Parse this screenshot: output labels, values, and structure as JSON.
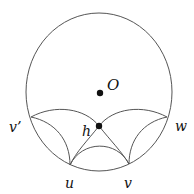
{
  "diagram": {
    "title": "",
    "stroke_color": "#555555",
    "point_color": "#111111",
    "boundary_circle": {
      "cx": 99,
      "cy": 92,
      "rx": 73,
      "ry": 79
    },
    "points": [
      {
        "id": "O",
        "label": "O",
        "x": 100,
        "y": 93,
        "dot": true
      },
      {
        "id": "h",
        "label": "h",
        "x": 99,
        "y": 126,
        "dot": true
      },
      {
        "id": "v_prime",
        "label": "v’",
        "x": 31,
        "y": 117,
        "dot": false
      },
      {
        "id": "w",
        "label": "w",
        "x": 167,
        "y": 117,
        "dot": false
      },
      {
        "id": "u",
        "label": "u",
        "x": 70,
        "y": 165,
        "dot": false
      },
      {
        "id": "v",
        "label": "v",
        "x": 129,
        "y": 164,
        "dot": false
      }
    ],
    "labels": {
      "O": "O",
      "h": "h",
      "v_prime": "v’",
      "w": "w",
      "u": "u",
      "v": "v"
    },
    "arcs": [
      {
        "id": "vprime-h-v",
        "from": "v’",
        "through": "h",
        "to": "v"
      },
      {
        "id": "w-h-u",
        "from": "w",
        "through": "h",
        "to": "u"
      },
      {
        "id": "vprime-u",
        "from": "v’",
        "to": "u"
      },
      {
        "id": "w-v",
        "from": "w",
        "to": "v"
      },
      {
        "id": "u-v",
        "from": "u",
        "to": "v"
      }
    ]
  }
}
